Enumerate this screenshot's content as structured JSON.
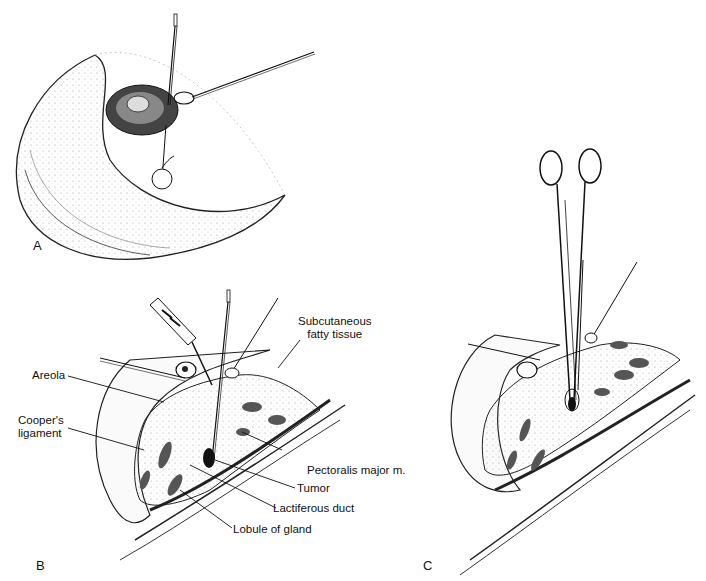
{
  "figure": {
    "panels": [
      {
        "letter": "A",
        "description": "Breast with probe through areola and marked lesion"
      },
      {
        "letter": "B",
        "description": "Cross-section with incision, instruments and labeled anatomy"
      },
      {
        "letter": "C",
        "description": "Cross-section with clamp grasping tumor"
      }
    ],
    "labels": {
      "subcutaneous_line1": "Subcutaneous",
      "subcutaneous_line2": "fatty tissue",
      "areola": "Areola",
      "coopers_line1": "Cooper's",
      "coopers_line2": "ligament",
      "pectoralis": "Pectoralis major m.",
      "tumor": "Tumor",
      "lactiferous": "Lactiferous duct",
      "lobule": "Lobule of gland"
    }
  }
}
